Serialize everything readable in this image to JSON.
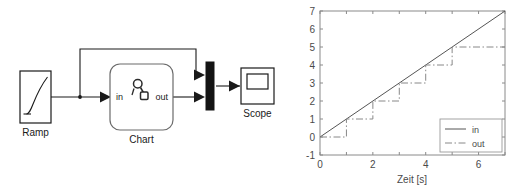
{
  "model": {
    "title": "Simulink model",
    "blocks": [
      {
        "id": "ramp",
        "label": "Ramp",
        "icon": "ramp-icon"
      },
      {
        "id": "chart",
        "label": "Chart",
        "icon": "stateflow-icon",
        "ports": {
          "input": "in",
          "output": "out"
        }
      },
      {
        "id": "mux",
        "label": "",
        "icon": "mux-bar-icon"
      },
      {
        "id": "scope",
        "label": "Scope",
        "icon": "scope-screen-icon"
      }
    ],
    "signal_color": "#1a1a1a",
    "block_color": "#1a1a1a"
  },
  "chart_data": {
    "type": "line",
    "title": "",
    "xlabel": "Zeit [s]",
    "ylabel": "",
    "xlim": [
      0,
      7
    ],
    "ylim": [
      -1,
      7
    ],
    "xticks": [
      0,
      2,
      4,
      6
    ],
    "xticklabels": [
      "0",
      "2",
      "4",
      "6"
    ],
    "yticks": [
      -1,
      0,
      1,
      2,
      3,
      4,
      5,
      6,
      7
    ],
    "yticklabels": [
      "-1",
      "0",
      "1",
      "2",
      "3",
      "4",
      "5",
      "6",
      "7"
    ],
    "grid": false,
    "legend_position": "lower right",
    "series": [
      {
        "name": "in",
        "style": "solid",
        "color": "#555555",
        "x": [
          0,
          7
        ],
        "y": [
          0,
          7
        ]
      },
      {
        "name": "out",
        "style": "dashdot",
        "color": "#888888",
        "step": "post",
        "x": [
          0,
          1,
          1,
          2,
          2,
          3,
          3,
          4,
          4,
          5,
          5,
          7
        ],
        "y": [
          0,
          0,
          1,
          1,
          2,
          2,
          3,
          3,
          4,
          4,
          5,
          5
        ]
      }
    ],
    "legend_entries": [
      "in",
      "out"
    ]
  }
}
